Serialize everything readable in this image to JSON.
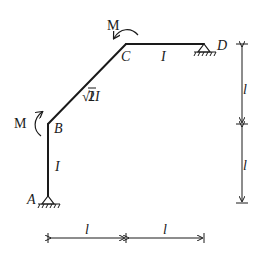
{
  "diagram": {
    "type": "structural-frame",
    "nodes": {
      "A": {
        "label": "A",
        "support": "pin"
      },
      "B": {
        "label": "B"
      },
      "C": {
        "label": "C"
      },
      "D": {
        "label": "D",
        "support": "pin"
      }
    },
    "members": {
      "AB": {
        "stiffness": "I"
      },
      "BC": {
        "stiffness_prefix": "√2",
        "stiffness_suffix": "I"
      },
      "CD": {
        "stiffness": "I"
      }
    },
    "moments": {
      "at_B": {
        "label": "M",
        "direction": "clockwise"
      },
      "at_C": {
        "label": "M",
        "direction": "counterclockwise"
      }
    },
    "dimensions": {
      "horizontal": [
        "l",
        "l"
      ],
      "vertical": [
        "l",
        "l"
      ]
    }
  }
}
